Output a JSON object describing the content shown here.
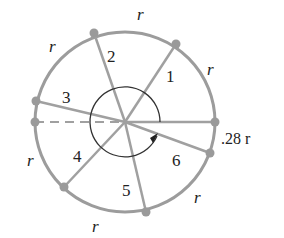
{
  "diagram": {
    "type": "radian-circle",
    "colors": {
      "circle": "#9c9c9c",
      "radius": "#a0a0a0",
      "dot": "#9a9a9a",
      "arc": "#333333",
      "text": "#222222"
    },
    "arc_labels": {
      "top": "r",
      "upper_left": "r",
      "upper_right": "r",
      "lower_left": "r",
      "bottom": "r",
      "lower_right": "r",
      "remainder": ".28 r"
    },
    "radius_labels": [
      "1",
      "2",
      "3",
      "4",
      "5",
      "6"
    ]
  }
}
